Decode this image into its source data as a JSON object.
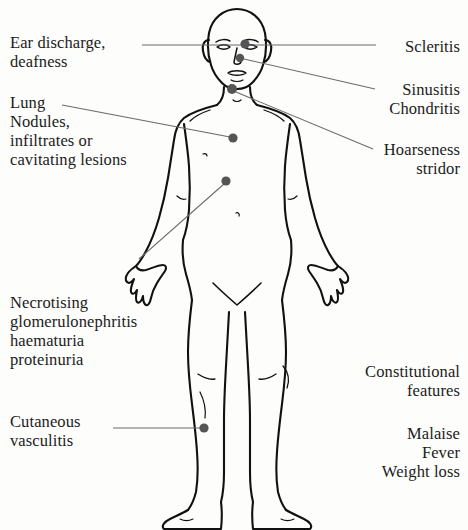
{
  "figure": {
    "colors": {
      "outline": "#111111",
      "marker_dot": "#555555",
      "leader_line": "#6b6b6b",
      "background": "#fdfdfc",
      "text": "#1b1b1b"
    }
  },
  "labels": {
    "ear": "Ear discharge,\ndeafness",
    "lung": "Lung\nNodules,\ninfiltrates or\ncavitating lesions",
    "renal": "Necrotising\nglomerulonephritis\nhaematuria\nproteinuria",
    "skin": "Cutaneous\nvasculitis",
    "scleritis": "Scleritis",
    "sinus": "Sinusitis\nChondritis",
    "hoarseness": "Hoarseness\nstridor",
    "constitutional": "Constitutional\nfeatures",
    "systemic": "Malaise\nFever\nWeight loss"
  },
  "markers": [
    {
      "name": "marker-ear-eye",
      "x": 245,
      "y": 44,
      "r": 4.6,
      "label": "ear"
    },
    {
      "name": "marker-sinus",
      "x": 240,
      "y": 58,
      "r": 4.2,
      "label": "sinus"
    },
    {
      "name": "marker-larynx",
      "x": 232,
      "y": 89,
      "r": 5.0,
      "label": "hoarseness"
    },
    {
      "name": "marker-lung",
      "x": 233,
      "y": 138,
      "r": 4.6,
      "label": "lung"
    },
    {
      "name": "marker-kidney",
      "x": 226,
      "y": 181,
      "r": 4.6,
      "label": "renal"
    },
    {
      "name": "marker-skin-leg",
      "x": 204,
      "y": 428,
      "r": 4.6,
      "label": "skin"
    }
  ],
  "leader_lines": [
    {
      "name": "leader-ear",
      "x1": 142,
      "y1": 45,
      "x2": 242,
      "y2": 45
    },
    {
      "name": "leader-lung",
      "x1": 62,
      "y1": 105,
      "x2": 230,
      "y2": 137
    },
    {
      "name": "leader-renal",
      "x1": 139,
      "y1": 259,
      "x2": 224,
      "y2": 184
    },
    {
      "name": "leader-skin",
      "x1": 113,
      "y1": 428,
      "x2": 201,
      "y2": 428
    },
    {
      "name": "leader-scleritis",
      "x1": 249,
      "y1": 45,
      "x2": 376,
      "y2": 45
    },
    {
      "name": "leader-sinus",
      "x1": 244,
      "y1": 59,
      "x2": 375,
      "y2": 89
    },
    {
      "name": "leader-hoarseness",
      "x1": 236,
      "y1": 92,
      "x2": 373,
      "y2": 149
    }
  ]
}
